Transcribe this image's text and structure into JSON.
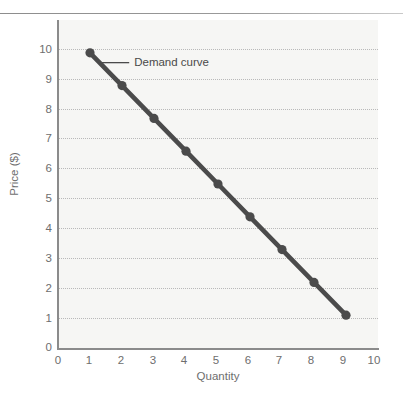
{
  "chart_data": {
    "type": "line",
    "title": "",
    "xlabel": "Quantity",
    "ylabel": "Price ($)",
    "xlim": [
      0,
      10
    ],
    "ylim": [
      0,
      10
    ],
    "xticks": [
      "0",
      "1",
      "2",
      "3",
      "4",
      "5",
      "6",
      "7",
      "8",
      "9",
      "10"
    ],
    "yticks": [
      "0",
      "1",
      "2",
      "3",
      "4",
      "5",
      "6",
      "7",
      "8",
      "9",
      "10"
    ],
    "grid": "horizontal-dotted",
    "legend": "none",
    "series": [
      {
        "name": "Demand curve",
        "x": [
          1,
          2,
          3,
          4,
          5,
          6,
          7,
          8,
          9
        ],
        "values": [
          9,
          8,
          7,
          6,
          5,
          4,
          3,
          2,
          1
        ],
        "color": "#4b4b4b",
        "marker": "circle"
      }
    ],
    "annotations": [
      {
        "text": "Demand curve",
        "target_point": [
          1.3,
          8.7
        ],
        "label_x": 2.35,
        "label_y": 8.7
      }
    ]
  },
  "colors": {
    "plot_background": "#f6f6f4",
    "gridline": "#b9b9b9",
    "axis": "#8b8b8b",
    "tick_text": "#6e6e6e",
    "series_line": "#4b4b4b",
    "top_rule": "#8d8d8d"
  }
}
